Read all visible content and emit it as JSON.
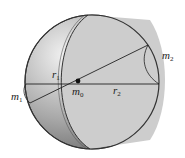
{
  "diagram": {
    "labels": {
      "m1": {
        "base": "m",
        "sub": "1"
      },
      "m2": {
        "base": "m",
        "sub": "2"
      },
      "m0": {
        "base": "m",
        "sub": "0"
      },
      "r1": {
        "base": "r",
        "sub": "1"
      },
      "r2": {
        "base": "r",
        "sub": "2"
      }
    },
    "colors": {
      "shell_light": "#d9d9d9",
      "shell_dark": "#8a8a8a",
      "interior": "#cfcfcf",
      "line": "#222222"
    }
  }
}
